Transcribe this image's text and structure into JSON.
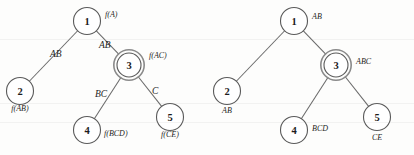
{
  "figure": {
    "background_color": "#fdfdfc",
    "ink_color": "#5a5a5a",
    "text_color": "#1d1d1d"
  },
  "diagrams": [
    {
      "id": "left-tree",
      "name": "tree-with-f-labels",
      "nodes": [
        {
          "id": "L1",
          "number": "1",
          "label": "f(A)",
          "cx": 87,
          "cy": 21,
          "r": 13.5,
          "double": false,
          "label_x": 105,
          "label_y": 17,
          "label_anchor": "start"
        },
        {
          "id": "L2",
          "number": "2",
          "label": "f(AB)",
          "cx": 20,
          "cy": 91,
          "r": 13.5,
          "double": false,
          "label_x": 20,
          "label_y": 111,
          "label_anchor": "middle"
        },
        {
          "id": "L3",
          "number": "3",
          "label": "f(AC)",
          "cx": 129,
          "cy": 65,
          "r": 12.0,
          "double": true,
          "label_x": 149,
          "label_y": 58,
          "label_anchor": "start"
        },
        {
          "id": "L4",
          "number": "4",
          "label": "f(BCD)",
          "cx": 87,
          "cy": 130,
          "r": 13.5,
          "double": false,
          "label_x": 104,
          "label_y": 136,
          "label_anchor": "start"
        },
        {
          "id": "L5",
          "number": "5",
          "label": "f(CE)",
          "cx": 170,
          "cy": 117,
          "r": 13.5,
          "double": false,
          "label_x": 170,
          "label_y": 137,
          "label_anchor": "middle"
        }
      ],
      "edges": [
        {
          "id": "L1-L2",
          "from": "L1",
          "to": "L2",
          "label": "AB",
          "label_x": 50,
          "label_y": 57
        },
        {
          "id": "L1-L3",
          "from": "L1",
          "to": "L3",
          "label": "AB",
          "label_x": 99,
          "label_y": 48
        },
        {
          "id": "L3-L4",
          "from": "L3",
          "to": "L4",
          "label": "BC",
          "label_x": 95,
          "label_y": 97
        },
        {
          "id": "L3-L5",
          "from": "L3",
          "to": "L5",
          "label": "C",
          "label_x": 152,
          "label_y": 94
        }
      ]
    },
    {
      "id": "right-tree",
      "name": "tree-with-set-labels",
      "nodes": [
        {
          "id": "R1",
          "number": "1",
          "label": "AB",
          "cx": 294,
          "cy": 21,
          "r": 13.5,
          "double": false,
          "label_x": 312,
          "label_y": 19,
          "label_anchor": "start"
        },
        {
          "id": "R2",
          "number": "2",
          "label": "AB",
          "cx": 227,
          "cy": 91,
          "r": 13.5,
          "double": false,
          "label_x": 227,
          "label_y": 113,
          "label_anchor": "middle"
        },
        {
          "id": "R3",
          "number": "3",
          "label": "ABC",
          "cx": 336,
          "cy": 65,
          "r": 12.0,
          "double": true,
          "label_x": 356,
          "label_y": 64,
          "label_anchor": "start"
        },
        {
          "id": "R4",
          "number": "4",
          "label": "BCD",
          "cx": 294,
          "cy": 130,
          "r": 13.5,
          "double": false,
          "label_x": 312,
          "label_y": 131,
          "label_anchor": "start"
        },
        {
          "id": "R5",
          "number": "5",
          "label": "CE",
          "cx": 377,
          "cy": 117,
          "r": 13.5,
          "double": false,
          "label_x": 377,
          "label_y": 140,
          "label_anchor": "middle"
        }
      ],
      "edges": [
        {
          "id": "R1-R2",
          "from": "R1",
          "to": "R2",
          "label": "",
          "label_x": 0,
          "label_y": 0
        },
        {
          "id": "R1-R3",
          "from": "R1",
          "to": "R3",
          "label": "",
          "label_x": 0,
          "label_y": 0
        },
        {
          "id": "R3-R4",
          "from": "R3",
          "to": "R4",
          "label": "",
          "label_x": 0,
          "label_y": 0
        },
        {
          "id": "R3-R5",
          "from": "R3",
          "to": "R5",
          "label": "",
          "label_x": 0,
          "label_y": 0
        }
      ]
    }
  ],
  "artifacts": {
    "scanlines": [
      39,
      103,
      122
    ]
  }
}
